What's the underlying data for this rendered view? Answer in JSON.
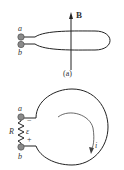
{
  "figure_a": {
    "caption": "(a)",
    "field_label": "B",
    "terminal_a": "a",
    "terminal_b": "b"
  },
  "figure_b": {
    "terminal_a": "a",
    "terminal_b": "b",
    "resistor_label": "R",
    "emf_label": "ε",
    "minus_sign": "−",
    "plus_sign": "+",
    "current_label": "i"
  },
  "colors": {
    "line": "#222222",
    "terminal_fill": "#8a8a8a",
    "text": "#333333"
  }
}
